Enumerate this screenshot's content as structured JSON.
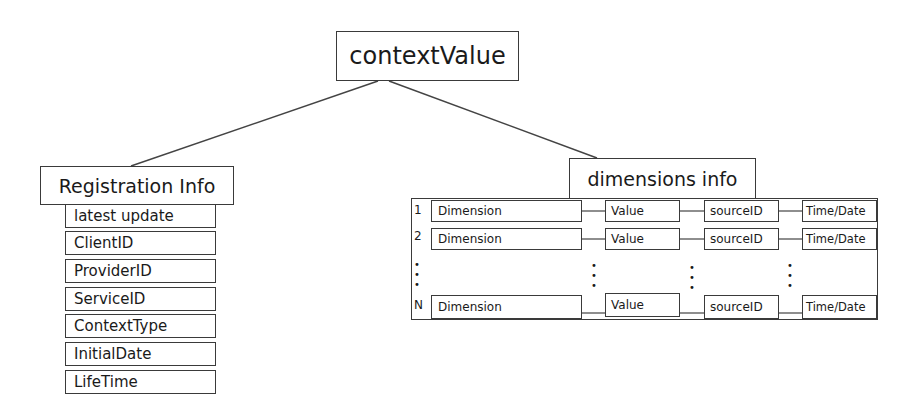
{
  "root": {
    "label": "contextValue"
  },
  "registration": {
    "label": "Registration Info",
    "items": [
      "latest update",
      "ClientID",
      "ProviderID",
      "ServiceID",
      "ContextType",
      "InitialDate",
      "LifeTime"
    ]
  },
  "dimensions": {
    "label": "dimensions info",
    "rows": [
      {
        "index": "1",
        "dimension": "Dimension",
        "value": "Value",
        "source": "sourceID",
        "time": "Time/Date"
      },
      {
        "index": "2",
        "dimension": "Dimension",
        "value": "Value",
        "source": "sourceID",
        "time": "Time/Date"
      },
      {
        "index": "N",
        "dimension": "Dimension",
        "value": "Value",
        "source": "sourceID",
        "time": "Time/Date"
      }
    ],
    "ellipsis": "⋮"
  }
}
